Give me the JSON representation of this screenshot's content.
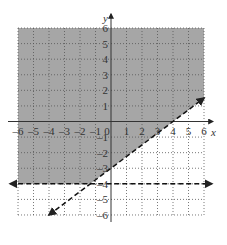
{
  "chart_data": {
    "type": "inequality-graph",
    "title": "",
    "xlabel": "x",
    "ylabel": "y",
    "xlim": [
      -6,
      6
    ],
    "ylim": [
      -6,
      6
    ],
    "grid": true,
    "grid_style": "dotted",
    "x_ticks": [
      "-6",
      "-5",
      "-4",
      "-3",
      "-2",
      "-1",
      "0",
      "1",
      "2",
      "3",
      "4",
      "5",
      "6"
    ],
    "y_ticks": [
      "6",
      "5",
      "4",
      "3",
      "2",
      "1",
      "-1",
      "-2",
      "-3",
      "-4",
      "-5",
      "-6"
    ],
    "boundaries": [
      {
        "name": "y = (3/4)x - 3",
        "slope": 0.75,
        "intercept": -3,
        "style": "dashed",
        "x_start": -4,
        "x_end": 6
      },
      {
        "name": "y = -4",
        "slope": 0,
        "intercept": -4,
        "style": "dashed",
        "x_start": -6.5,
        "x_end": 6.5
      }
    ],
    "shaded_region": "y > (3/4)x - 3 and y > -4",
    "shade_color": "#a6a6a6"
  }
}
